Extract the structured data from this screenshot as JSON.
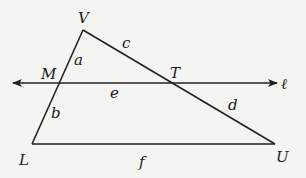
{
  "diagram": {
    "type": "geometry-figure",
    "points": {
      "V": {
        "label": "V",
        "x": 83,
        "y": 30
      },
      "M": {
        "label": "M",
        "x": 60,
        "y": 83
      },
      "T": {
        "label": "T",
        "x": 175,
        "y": 83
      },
      "L": {
        "label": "L",
        "x": 32,
        "y": 144
      },
      "U": {
        "label": "U",
        "x": 275,
        "y": 144
      }
    },
    "segments": [
      {
        "from": "V",
        "to": "M",
        "label": "a"
      },
      {
        "from": "M",
        "to": "L",
        "label": "b"
      },
      {
        "from": "V",
        "to": "T",
        "label": "c"
      },
      {
        "from": "T",
        "to": "U",
        "label": "d"
      },
      {
        "from": "M",
        "to": "T",
        "label": "e"
      },
      {
        "from": "L",
        "to": "U",
        "label": "f"
      }
    ],
    "line": {
      "label": "ℓ",
      "y": 83,
      "x_start": 13,
      "x_end": 277,
      "arrows": "both"
    },
    "labels": {
      "V": "V",
      "M": "M",
      "T": "T",
      "L": "L",
      "U": "U",
      "a": "a",
      "b": "b",
      "c": "c",
      "d": "d",
      "e": "e",
      "f": "f",
      "ell": "ℓ"
    },
    "colors": {
      "background": "#f4f4f2",
      "ink": "#222222"
    }
  }
}
